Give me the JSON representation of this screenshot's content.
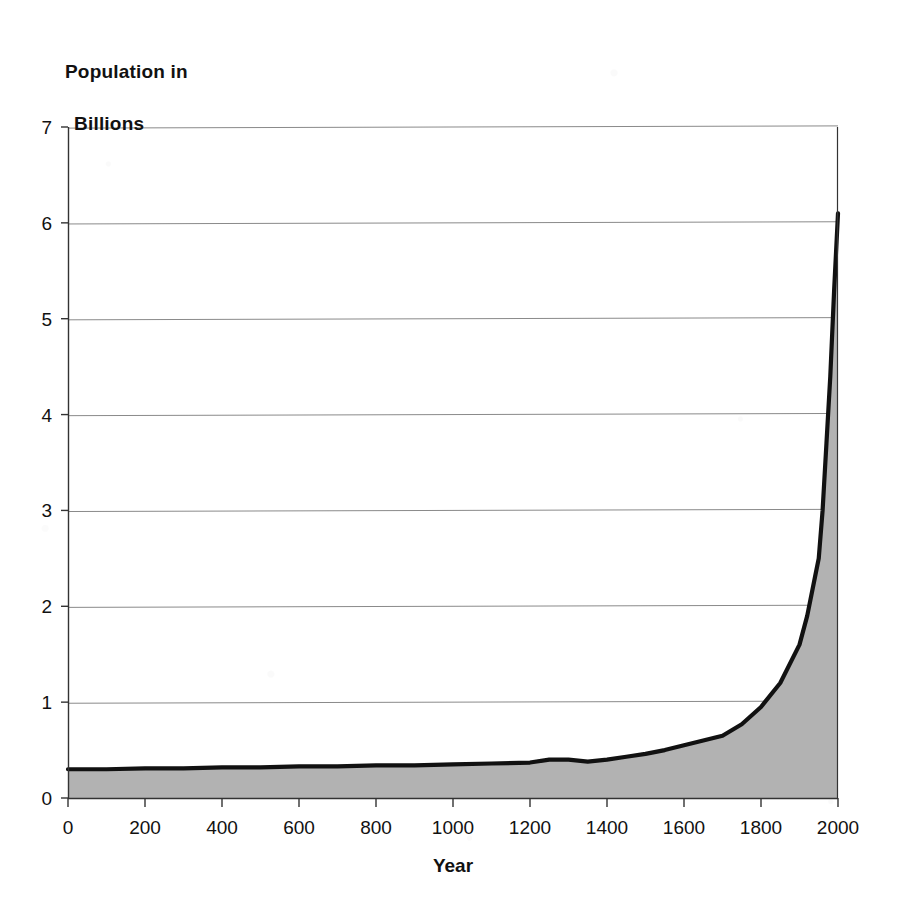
{
  "chart_data": {
    "type": "area",
    "title": "Population in Billions",
    "title_line1": "Population in",
    "title_line2": "Billions",
    "xlabel": "Year",
    "ylabel": "Population in Billions",
    "xlim": [
      0,
      2000
    ],
    "ylim": [
      0,
      7
    ],
    "grid": "horizontal",
    "legend": "none",
    "line_color": "#111111",
    "fill_color": "#b2b2b2",
    "axis_color": "#333333",
    "grid_color": "#8a8a8a",
    "xticks": [
      0,
      200,
      400,
      600,
      800,
      1000,
      1200,
      1400,
      1600,
      1800,
      2000
    ],
    "yticks": [
      0,
      1,
      2,
      3,
      4,
      5,
      6,
      7
    ],
    "xtick_labels": [
      "0",
      "200",
      "400",
      "600",
      "800",
      "1000",
      "1200",
      "1400",
      "1600",
      "1800",
      "2000"
    ],
    "ytick_labels": [
      "0",
      "1",
      "2",
      "3",
      "4",
      "5",
      "6",
      "7"
    ],
    "series": [
      {
        "name": "World population",
        "x": [
          0,
          100,
          200,
          300,
          400,
          500,
          600,
          700,
          800,
          900,
          1000,
          1100,
          1200,
          1250,
          1300,
          1350,
          1400,
          1450,
          1500,
          1550,
          1600,
          1650,
          1700,
          1750,
          1800,
          1850,
          1900,
          1920,
          1940,
          1950,
          1960,
          1970,
          1980,
          1990,
          2000
        ],
        "y": [
          0.3,
          0.3,
          0.31,
          0.31,
          0.32,
          0.32,
          0.33,
          0.33,
          0.34,
          0.34,
          0.35,
          0.36,
          0.37,
          0.4,
          0.4,
          0.38,
          0.4,
          0.43,
          0.46,
          0.5,
          0.55,
          0.6,
          0.65,
          0.77,
          0.95,
          1.2,
          1.6,
          1.9,
          2.3,
          2.5,
          3.0,
          3.7,
          4.4,
          5.3,
          6.1
        ]
      }
    ],
    "annotations": []
  },
  "axis_title": {
    "line1": "Population in",
    "line2": "Billions"
  },
  "x_axis": {
    "name": "Year"
  }
}
